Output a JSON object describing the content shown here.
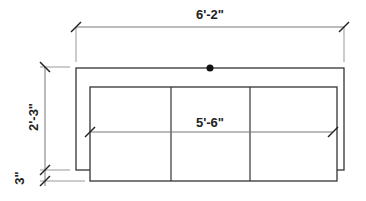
{
  "diagram": {
    "type": "furniture-plan-sofa",
    "colors": {
      "line": "#333333",
      "dim_line": "#777777",
      "tick": "#222222",
      "dot": "#111111",
      "background": "#ffffff"
    },
    "dimensions": {
      "overall_width": "6'-2\"",
      "seat_width": "5'-6\"",
      "depth": "2'-3\"",
      "offset": "3\""
    },
    "cushions": 3
  }
}
